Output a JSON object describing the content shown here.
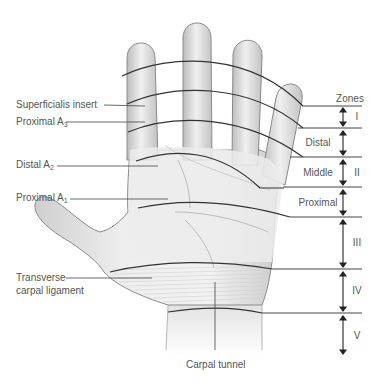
{
  "diagram": {
    "left_labels": [
      {
        "id": "superficialis-insert",
        "text": "Superficialis insert",
        "sub": "",
        "x": 16,
        "y": 99
      },
      {
        "id": "proximal-a3",
        "text": "Proximal A",
        "sub": "3",
        "x": 16,
        "y": 117
      },
      {
        "id": "distal-a2",
        "text": "Distal A",
        "sub": "2",
        "x": 16,
        "y": 160
      },
      {
        "id": "proximal-a1",
        "text": "Proximal A",
        "sub": "1",
        "x": 16,
        "y": 193
      },
      {
        "id": "transverse-carpal-ligament-1",
        "text": "Transverse",
        "sub": "",
        "x": 16,
        "y": 272
      },
      {
        "id": "transverse-carpal-ligament-2",
        "text": "carpal ligament",
        "sub": "",
        "x": 16,
        "y": 285
      }
    ],
    "bottom_label": {
      "text": "Carpal tunnel",
      "x": 188,
      "y": 360
    },
    "zones_header": "Zones",
    "thumb_subzones": [
      {
        "label": "Distal",
        "y": 142
      },
      {
        "label": "Middle",
        "y": 172
      },
      {
        "label": "Proximal",
        "y": 202
      }
    ],
    "zones": [
      {
        "label": "I",
        "top": 106,
        "bottom": 128
      },
      {
        "label": "II",
        "top": 128,
        "bottom": 217
      },
      {
        "label": "III",
        "top": 217,
        "bottom": 269
      },
      {
        "label": "IV",
        "top": 269,
        "bottom": 313
      },
      {
        "label": "V",
        "top": 313,
        "bottom": 356
      }
    ],
    "colors": {
      "line": "#333333",
      "label": "#555555",
      "skin": "#e4e4e4",
      "skin_edge": "#8a8a8a"
    }
  }
}
